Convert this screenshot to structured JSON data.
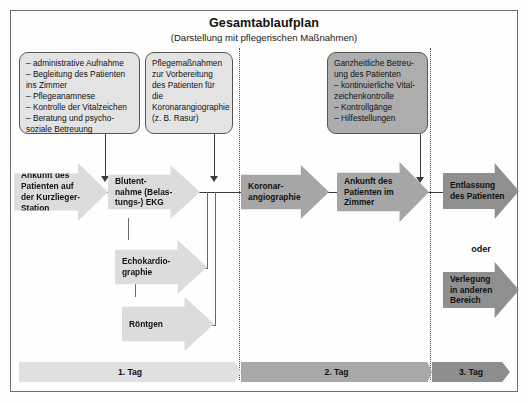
{
  "header": {
    "title": "Gesamtablaufplan",
    "subtitle": "(Darstellung mit pflegerischen Maßnahmen)"
  },
  "notes": [
    {
      "id": "note-admission-care",
      "text": "– administrative Aufnahme\n– Begleitung des Patienten\n   ins Zimmer\n– Pflegeanamnese\n– Kontrolle der Vitalzeichen\n– Beratung und psycho-\n   soziale Betreuung"
    },
    {
      "id": "note-preparation",
      "text": "Pflegemaßnahmen\nzur Vorbereitung\ndes Patienten für die\nKoronarangiographie\n(z. B. Rasur)"
    },
    {
      "id": "note-holistic-care",
      "text": "Ganzheitliche Betreu-\nung des Patienten\n– kontinuierliche Vital-\n   zeichenkontrolle\n– Kontrollgänge\n– Hilfestellungen"
    }
  ],
  "steps": [
    {
      "id": "step-arrival",
      "text": "Ankunft des\nPatienten auf\nder Kurzlieger-\nStation"
    },
    {
      "id": "step-bloodtest-ekg",
      "text": "Blutent-\nnahme (Belas-\ntungs-) EKG"
    },
    {
      "id": "step-echocardiography",
      "text": "Echokardio-\ngraphie"
    },
    {
      "id": "step-xray",
      "text": "Röntgen"
    },
    {
      "id": "step-coronary-angiography",
      "text": "Koronar-\nangiographie"
    },
    {
      "id": "step-arrival-room",
      "text": "Ankunft des\nPatienten im\nZimmer"
    },
    {
      "id": "step-discharge",
      "text": "Entlassung\ndes Patienten"
    },
    {
      "id": "step-transfer",
      "text": "Verlegung\nin anderen\nBereich"
    }
  ],
  "connectors": {
    "or_label": "oder"
  },
  "timeline": [
    {
      "id": "day-1",
      "label": "1. Tag"
    },
    {
      "id": "day-2",
      "label": "2. Tag"
    },
    {
      "id": "day-3",
      "label": "3. Tag"
    }
  ],
  "colors": {
    "arrow_light": "#dcdcdc",
    "arrow_mid": "#a6a6a6",
    "arrow_dark": "#8f8f8f",
    "note_light": "#e3e3e3",
    "note_mid": "#adadad",
    "line": "#3a3a3a",
    "frame": "#6e6e6e"
  }
}
